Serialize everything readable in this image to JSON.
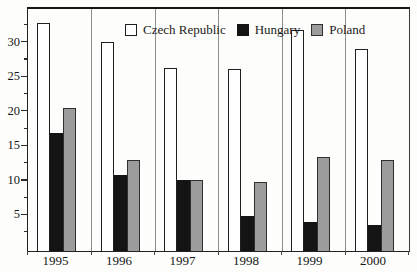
{
  "chart_data": {
    "type": "bar",
    "title": "",
    "categories": [
      "1995",
      "1996",
      "1997",
      "1998",
      "1999",
      "2000"
    ],
    "series": [
      {
        "name": "Czech Republic",
        "fill": "#ffffff",
        "border": "#1f1f1f",
        "values": [
          33,
          30.2,
          26.5,
          26.3,
          32,
          29.2
        ]
      },
      {
        "name": "Hungary",
        "fill": "#141414",
        "border": "#141414",
        "values": [
          17,
          11,
          10.2,
          5,
          4.2,
          3.8
        ]
      },
      {
        "name": "Poland",
        "fill": "#9c9c9c",
        "border": "#2f2f2f",
        "values": [
          20.7,
          13.2,
          10.3,
          10,
          13.6,
          13.1
        ]
      }
    ],
    "ylim": [
      0,
      35
    ],
    "yticks": [
      5,
      10,
      15,
      20,
      25,
      30
    ],
    "minor_tick_step": 2.5,
    "legend_position": "top-inside",
    "grid": "vertical-category-separators",
    "frame_color": "#2a2a2a",
    "background_color": "#fdfdfb"
  }
}
